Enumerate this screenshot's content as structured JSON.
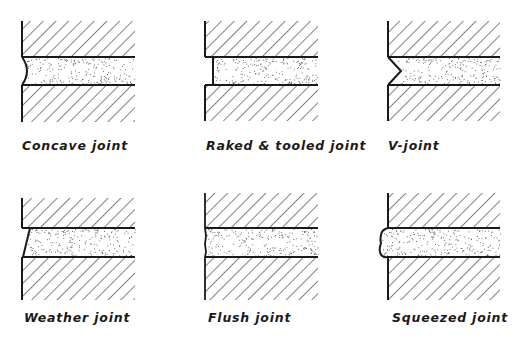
{
  "figure": {
    "joints": [
      {
        "id": "concave",
        "label": "Concave joint",
        "profile": "concave"
      },
      {
        "id": "raked",
        "label": "Raked & tooled joint",
        "profile": "raked"
      },
      {
        "id": "v",
        "label": "V-joint",
        "profile": "v"
      },
      {
        "id": "weather",
        "label": "Weather joint",
        "profile": "weather"
      },
      {
        "id": "flush",
        "label": "Flush joint",
        "profile": "flush"
      },
      {
        "id": "squeezed",
        "label": "Squeezed joint",
        "profile": "squeezed"
      }
    ]
  },
  "colors": {
    "ink": "#1a1a1a",
    "background": "#ffffff",
    "mortar_dots": "#555555"
  }
}
